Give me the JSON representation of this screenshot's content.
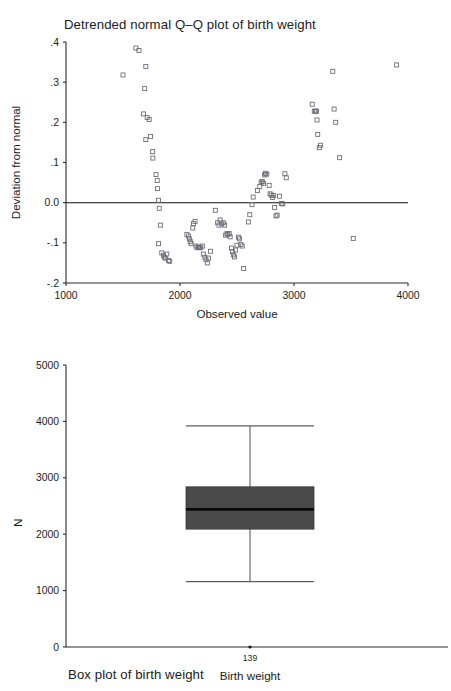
{
  "chart_data": [
    {
      "type": "scatter",
      "title": "Detrended normal Q–Q plot of birth weight",
      "xlabel": "Observed value",
      "ylabel": "Deviation from normal",
      "xlim": [
        1000,
        4000
      ],
      "ylim": [
        -0.2,
        0.4
      ],
      "xticks": [
        1000,
        2000,
        3000,
        4000
      ],
      "xticklabels": [
        "1000",
        "2000",
        "3000",
        "4000"
      ],
      "yticks": [
        0.4,
        0.3,
        0.2,
        0.1,
        0.0,
        -0.1,
        -0.2
      ],
      "yticklabels": [
        ".4",
        ".3",
        ".2",
        ".1",
        "0.0",
        "-.1",
        "-.2"
      ],
      "grid": false,
      "legend": "none",
      "reference_line": {
        "y": 0.0,
        "from_x": 1000,
        "to_x": 4000
      },
      "marker": "open-square",
      "points": [
        [
          1500,
          0.318
        ],
        [
          1613,
          0.385
        ],
        [
          1640,
          0.379
        ],
        [
          1700,
          0.339
        ],
        [
          1690,
          0.284
        ],
        [
          1680,
          0.221
        ],
        [
          1712,
          0.212
        ],
        [
          1730,
          0.207
        ],
        [
          1700,
          0.157
        ],
        [
          1742,
          0.165
        ],
        [
          1760,
          0.127
        ],
        [
          1762,
          0.111
        ],
        [
          1790,
          0.07
        ],
        [
          1800,
          0.055
        ],
        [
          1802,
          0.035
        ],
        [
          1812,
          0.006
        ],
        [
          1818,
          -0.014
        ],
        [
          1828,
          -0.056
        ],
        [
          1812,
          -0.102
        ],
        [
          1840,
          -0.125
        ],
        [
          1855,
          -0.131
        ],
        [
          1862,
          -0.136
        ],
        [
          1872,
          -0.138
        ],
        [
          1884,
          -0.128
        ],
        [
          1898,
          -0.144
        ],
        [
          1910,
          -0.146
        ],
        [
          2060,
          -0.079
        ],
        [
          2075,
          -0.083
        ],
        [
          2082,
          -0.09
        ],
        [
          2090,
          -0.097
        ],
        [
          2098,
          -0.102
        ],
        [
          2112,
          -0.063
        ],
        [
          2118,
          -0.052
        ],
        [
          2132,
          -0.047
        ],
        [
          2140,
          -0.108
        ],
        [
          2150,
          -0.112
        ],
        [
          2162,
          -0.11
        ],
        [
          2170,
          -0.112
        ],
        [
          2182,
          -0.112
        ],
        [
          2196,
          -0.108
        ],
        [
          2205,
          -0.128
        ],
        [
          2218,
          -0.136
        ],
        [
          2228,
          -0.142
        ],
        [
          2240,
          -0.15
        ],
        [
          2250,
          -0.138
        ],
        [
          2268,
          -0.121
        ],
        [
          2310,
          -0.019
        ],
        [
          2330,
          -0.05
        ],
        [
          2342,
          -0.056
        ],
        [
          2352,
          -0.043
        ],
        [
          2366,
          -0.053
        ],
        [
          2380,
          -0.05
        ],
        [
          2392,
          -0.056
        ],
        [
          2400,
          -0.081
        ],
        [
          2412,
          -0.077
        ],
        [
          2420,
          -0.079
        ],
        [
          2432,
          -0.077
        ],
        [
          2440,
          -0.085
        ],
        [
          2452,
          -0.113
        ],
        [
          2460,
          -0.122
        ],
        [
          2468,
          -0.13
        ],
        [
          2478,
          -0.135
        ],
        [
          2488,
          -0.118
        ],
        [
          2500,
          -0.106
        ],
        [
          2512,
          -0.086
        ],
        [
          2522,
          -0.09
        ],
        [
          2534,
          -0.104
        ],
        [
          2546,
          -0.108
        ],
        [
          2558,
          -0.164
        ],
        [
          2600,
          -0.048
        ],
        [
          2612,
          -0.03
        ],
        [
          2632,
          -0.005
        ],
        [
          2642,
          0.014
        ],
        [
          2680,
          0.03
        ],
        [
          2700,
          0.04
        ],
        [
          2712,
          0.051
        ],
        [
          2722,
          0.053
        ],
        [
          2732,
          0.048
        ],
        [
          2742,
          0.069
        ],
        [
          2750,
          0.073
        ],
        [
          2762,
          0.071
        ],
        [
          2782,
          0.043
        ],
        [
          2790,
          0.022
        ],
        [
          2800,
          0.019
        ],
        [
          2812,
          0.013
        ],
        [
          2822,
          0.018
        ],
        [
          2830,
          -0.012
        ],
        [
          2842,
          -0.033
        ],
        [
          2852,
          -0.031
        ],
        [
          2872,
          0.016
        ],
        [
          2890,
          -0.002
        ],
        [
          2902,
          -0.003
        ],
        [
          2920,
          0.072
        ],
        [
          2932,
          0.062
        ],
        [
          3160,
          0.245
        ],
        [
          3178,
          0.228
        ],
        [
          3188,
          0.227
        ],
        [
          3198,
          0.228
        ],
        [
          3202,
          0.206
        ],
        [
          3208,
          0.17
        ],
        [
          3222,
          0.137
        ],
        [
          3232,
          0.143
        ],
        [
          3340,
          0.327
        ],
        [
          3352,
          0.233
        ],
        [
          3366,
          0.2
        ],
        [
          3400,
          0.112
        ],
        [
          3520,
          -0.089
        ],
        [
          3900,
          0.343
        ]
      ]
    },
    {
      "type": "boxplot",
      "title": "Box plot of birth weight",
      "xlabel": "Birth weight",
      "ylabel": "N",
      "ylim": [
        0,
        5000
      ],
      "yticks": [
        0,
        1000,
        2000,
        3000,
        4000,
        5000
      ],
      "yticklabels": [
        "0",
        "1000",
        "2000",
        "3000",
        "4000",
        "5000"
      ],
      "grid": false,
      "legend": "none",
      "categories": [
        "139"
      ],
      "boxes": [
        {
          "category": "139",
          "lower_whisker": 1160,
          "q1": 2090,
          "median": 2440,
          "q3": 2840,
          "upper_whisker": 3920,
          "fill_color": "#4a4a4a",
          "median_color": "#0a0a0a"
        }
      ]
    }
  ]
}
